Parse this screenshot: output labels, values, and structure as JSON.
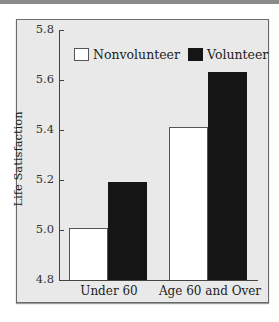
{
  "chart_data": {
    "type": "bar",
    "title": "",
    "xlabel": "",
    "ylabel": "Life Satisfaction",
    "ylim": [
      4.8,
      5.8
    ],
    "yticks": [
      "5.8",
      "5.6",
      "5.4",
      "5.2",
      "5.0",
      "4.8"
    ],
    "categories": [
      "Under 60",
      "Age 60 and Over"
    ],
    "series": [
      {
        "name": "Nonvolunteer",
        "color": "#ffffff",
        "values": [
          5.01,
          5.41
        ]
      },
      {
        "name": "Volunteer",
        "color": "#151515",
        "values": [
          5.19,
          5.63
        ]
      }
    ],
    "legend_position": "top",
    "grid": false
  }
}
